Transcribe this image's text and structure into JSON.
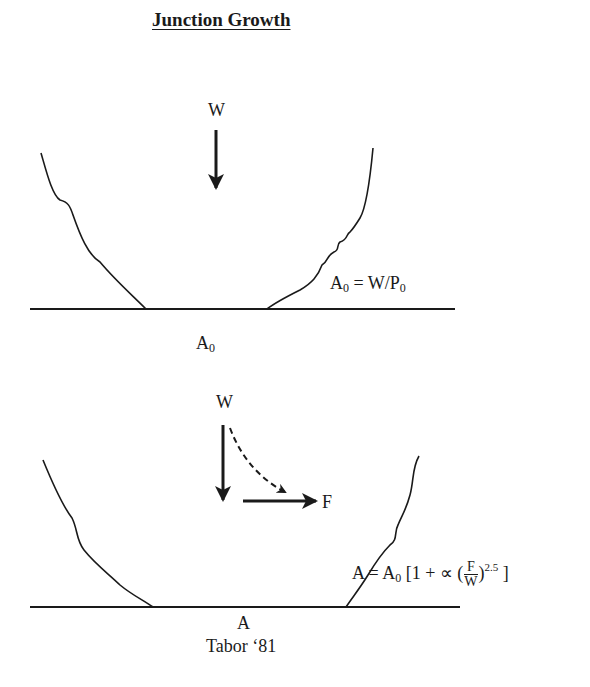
{
  "title": "Junction Growth",
  "top_diagram": {
    "load_label": "W",
    "area_label_base": "A",
    "area_label_sub": "0",
    "equation": {
      "lhs_base": "A",
      "lhs_sub": "0",
      "mid": " = W/P",
      "rhs_sub": "0"
    }
  },
  "bottom_diagram": {
    "load_label": "W",
    "force_label": "F",
    "area_label": "A",
    "citation": "Tabor ‘81",
    "equation": {
      "lhs": "A = A",
      "a0_sub": "0",
      "bracket_open": " [1 + ∝ (",
      "frac_num": "F",
      "frac_den": "W",
      "paren_close": ")",
      "exponent": "2.5",
      "bracket_close": " ]"
    }
  },
  "colors": {
    "ink": "#1a1a1a",
    "background": "#ffffff"
  }
}
